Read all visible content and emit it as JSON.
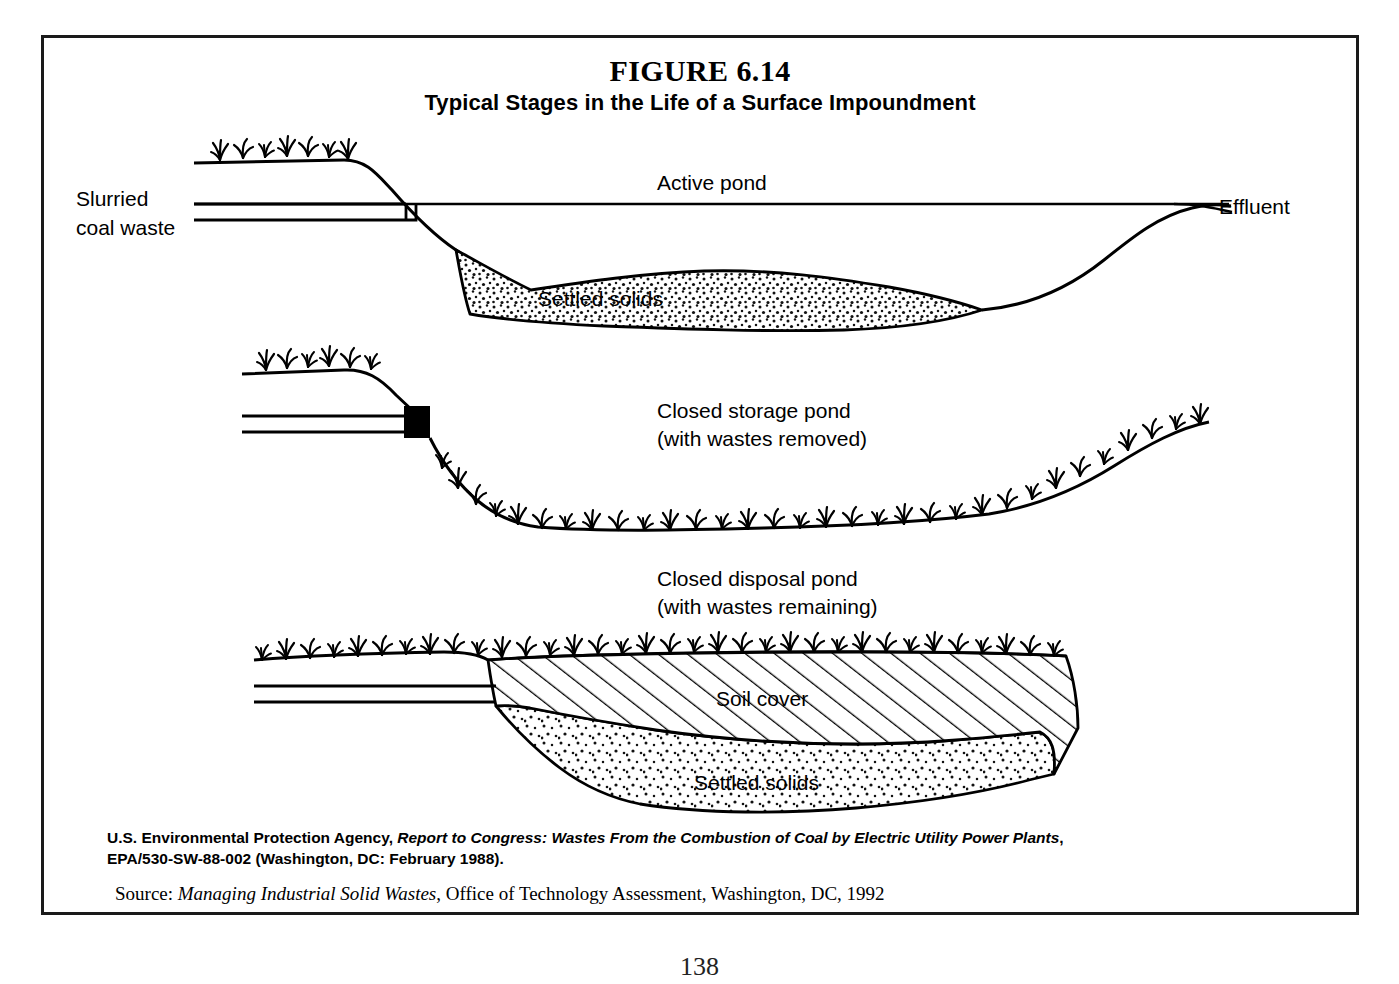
{
  "figure": {
    "number": "FIGURE 6.14",
    "title": "Typical Stages in the Life of a Surface Impoundment"
  },
  "panels": [
    {
      "id": "active-pond",
      "stage_label": "Active pond",
      "inflow_label_line1": "Slurried",
      "inflow_label_line2": "coal waste",
      "outflow_label": "Effluent",
      "sediment_label": "Settled solids"
    },
    {
      "id": "closed-storage-pond",
      "stage_label_line1": "Closed storage pond",
      "stage_label_line2": "(with wastes removed)"
    },
    {
      "id": "closed-disposal-pond",
      "stage_label_line1": "Closed disposal pond",
      "stage_label_line2": "(with wastes remaining)",
      "cover_label": "Soil cover",
      "sediment_label": "Settled solids"
    }
  ],
  "caption": {
    "epa_agency": "U.S. Environmental Protection Agency, ",
    "epa_title": "Report to Congress: Wastes From the Combustion of Coal by Electric Utility Power Plants",
    "epa_comma": ",",
    "epa_docnum": "EPA/530-SW-88-002 (Washington, DC: February 1988).",
    "source_prefix": "Source: ",
    "source_title": "Managing Industrial Solid Wastes",
    "source_rest": ", Office of Technology Assessment, Washington, DC, 1992"
  },
  "page_number": "138",
  "colors": {
    "ink": "#000000",
    "border": "#1a1a1a",
    "paper": "#ffffff"
  }
}
